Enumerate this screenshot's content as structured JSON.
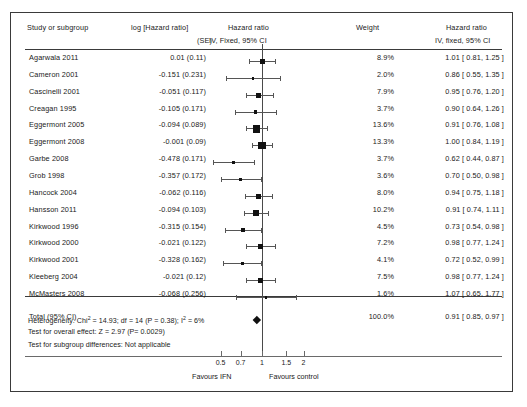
{
  "chart_data": {
    "type": "forest",
    "title": "",
    "columns": {
      "study": "Study or subgroup",
      "log_hr": "log [Hazard ratio]",
      "log_hr_sub": "(SE)",
      "hazard_ratio": "Hazard ratio",
      "hazard_ratio_sub": "IV, Fixed, 95% CI",
      "weight": "Weight",
      "hazard_ratio_right": "Hazard ratio",
      "hazard_ratio_right_sub": "IV, fixed, 95% CI"
    },
    "xlabel": "",
    "ylabel": "",
    "xscale": "log",
    "xlim": [
      0.4,
      2.6
    ],
    "xticks": [
      0.5,
      0.7,
      1,
      1.5,
      2
    ],
    "xtick_labels": [
      "0.5",
      "0.7",
      "1",
      "1.5",
      "2"
    ],
    "null_value": 1,
    "favours_left": "Favours IFN",
    "favours_right": "Favours control",
    "rows": [
      {
        "study": "Agarwala 2011",
        "log_se": "0.01 (0.11)",
        "weight": "8.9%",
        "weight_value": 8.9,
        "hr": "1.01 [ 0.81, 1.25 ]",
        "est": 1.01,
        "lo": 0.81,
        "hi": 1.25
      },
      {
        "study": "Cameron 2001",
        "log_se": "-0.151 (0.231)",
        "weight": "2.0%",
        "weight_value": 2.0,
        "hr": "0.86 [ 0.55, 1.35 ]",
        "est": 0.86,
        "lo": 0.55,
        "hi": 1.35
      },
      {
        "study": "Cascinelli 2001",
        "log_se": "-0.051 (0.117)",
        "weight": "7.9%",
        "weight_value": 7.9,
        "hr": "0.95 [ 0.76, 1.20 ]",
        "est": 0.95,
        "lo": 0.76,
        "hi": 1.2
      },
      {
        "study": "Creagan 1995",
        "log_se": "-0.105 (0.171)",
        "weight": "3.7%",
        "weight_value": 3.7,
        "hr": "0.90 [ 0.64, 1.26 ]",
        "est": 0.9,
        "lo": 0.64,
        "hi": 1.26
      },
      {
        "study": "Eggermont 2005",
        "log_se": "-0.094 (0.089)",
        "weight": "13.6%",
        "weight_value": 13.6,
        "hr": "0.91 [ 0.76, 1.08 ]",
        "est": 0.91,
        "lo": 0.76,
        "hi": 1.08
      },
      {
        "study": "Eggermont 2008",
        "log_se": "-0.001 (0.09)",
        "weight": "13.3%",
        "weight_value": 13.3,
        "hr": "1.00 [ 0.84, 1.19 ]",
        "est": 1.0,
        "lo": 0.84,
        "hi": 1.19
      },
      {
        "study": "Garbe 2008",
        "log_se": "-0.478 (0.171)",
        "weight": "3.7%",
        "weight_value": 3.7,
        "hr": "0.62 [ 0.44, 0.87 ]",
        "est": 0.62,
        "lo": 0.44,
        "hi": 0.87
      },
      {
        "study": "Grob 1998",
        "log_se": "-0.357 (0.172)",
        "weight": "3.6%",
        "weight_value": 3.6,
        "hr": "0.70 [ 0.50, 0.98 ]",
        "est": 0.7,
        "lo": 0.5,
        "hi": 0.98
      },
      {
        "study": "Hancock 2004",
        "log_se": "-0.062 (0.116)",
        "weight": "8.0%",
        "weight_value": 8.0,
        "hr": "0.94 [ 0.75, 1.18 ]",
        "est": 0.94,
        "lo": 0.75,
        "hi": 1.18
      },
      {
        "study": "Hansson 2011",
        "log_se": "-0.094 (0.103)",
        "weight": "10.2%",
        "weight_value": 10.2,
        "hr": "0.91 [ 0.74, 1.11 ]",
        "est": 0.91,
        "lo": 0.74,
        "hi": 1.11
      },
      {
        "study": "Kirkwood 1996",
        "log_se": "-0.315 (0.154)",
        "weight": "4.5%",
        "weight_value": 4.5,
        "hr": "0.73 [ 0.54, 0.98 ]",
        "est": 0.73,
        "lo": 0.54,
        "hi": 0.98
      },
      {
        "study": "Kirkwood 2000",
        "log_se": "-0.021 (0.122)",
        "weight": "7.2%",
        "weight_value": 7.2,
        "hr": "0.98 [ 0.77, 1.24 ]",
        "est": 0.98,
        "lo": 0.77,
        "hi": 1.24
      },
      {
        "study": "Kirkwood 2001",
        "log_se": "-0.328 (0.162)",
        "weight": "4.1%",
        "weight_value": 4.1,
        "hr": "0.72 [ 0.52, 0.99 ]",
        "est": 0.72,
        "lo": 0.52,
        "hi": 0.99
      },
      {
        "study": "Kleeberg 2004",
        "log_se": "-0.021 (0.12)",
        "weight": "7.5%",
        "weight_value": 7.5,
        "hr": "0.98 [ 0.77, 1.24 ]",
        "est": 0.98,
        "lo": 0.77,
        "hi": 1.24
      },
      {
        "study": "McMasters 2008",
        "log_se": "-0.068 (0.256)",
        "weight": "1.6%",
        "weight_value": 1.6,
        "hr": "1.07 [ 0.65, 1.77 ]",
        "est": 1.07,
        "lo": 0.65,
        "hi": 1.77
      }
    ],
    "total": {
      "label": "Total (95% CI)",
      "log_se": "-0.068 (0.256)",
      "weight": "100.0%",
      "hr": "0.91 [ 0.85, 0.97 ]",
      "est": 0.91,
      "lo": 0.85,
      "hi": 0.97
    },
    "statistics": {
      "heterogeneity_prefix": "Heterogeneity: Chi",
      "heterogeneity_sup1": "2",
      "heterogeneity_mid": " = 14.93; df = 14 (P = 0.38); I",
      "heterogeneity_sup2": "2",
      "heterogeneity_suffix": " = 6%",
      "overall_effect": "Test for overall effect: Z = 2.97 (P= 0.0029)",
      "subgroup_differences": "Test for subgroup differences: Not applicable"
    }
  }
}
